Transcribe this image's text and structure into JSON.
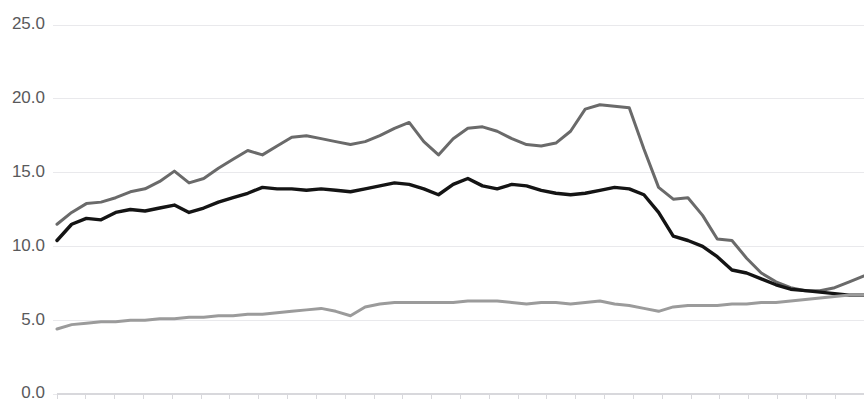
{
  "chart_data": {
    "type": "line",
    "title": "",
    "subtitle": "",
    "xlabel": "",
    "ylabel": "",
    "ylim": [
      0.0,
      25.0
    ],
    "xlim": [
      0,
      55
    ],
    "grid": true,
    "legend_position": "none",
    "y_ticks": [
      0.0,
      5.0,
      10.0,
      15.0,
      20.0,
      25.0
    ],
    "y_tick_labels": [
      "0.0",
      "5.0",
      "10.0",
      "15.0",
      "20.0",
      "25.0"
    ],
    "x_tick_labels": [],
    "x_minor_tick_count": 28,
    "colors": {
      "series_upper": "#6a6a6a",
      "series_middle": "#141414",
      "series_lower": "#9b9b9b",
      "gridline": "#e9e9ec",
      "axis": "#d8d8dc",
      "tick_label": "#59595b",
      "background": "#ffffff"
    },
    "x": [
      0,
      1,
      2,
      3,
      4,
      5,
      6,
      7,
      8,
      9,
      10,
      11,
      12,
      13,
      14,
      15,
      16,
      17,
      18,
      19,
      20,
      21,
      22,
      23,
      24,
      25,
      26,
      27,
      28,
      29,
      30,
      31,
      32,
      33,
      34,
      35,
      36,
      37,
      38,
      39,
      40,
      41,
      42,
      43,
      44,
      45,
      46,
      47,
      48,
      49,
      50,
      51,
      52,
      53,
      54,
      55
    ],
    "series": [
      {
        "name": "upper",
        "color": "#6a6a6a",
        "stroke_width": 3.0,
        "values": [
          11.5,
          12.3,
          12.9,
          13.0,
          13.3,
          13.7,
          13.9,
          14.4,
          15.1,
          14.3,
          14.6,
          15.3,
          15.9,
          16.5,
          16.2,
          16.8,
          17.4,
          17.5,
          17.3,
          17.1,
          16.9,
          17.1,
          17.5,
          18.0,
          18.4,
          17.1,
          16.2,
          17.3,
          18.0,
          18.1,
          17.8,
          17.3,
          16.9,
          16.8,
          17.0,
          17.8,
          19.3,
          19.6,
          19.5,
          19.4,
          16.6,
          14.0,
          13.2,
          13.3,
          12.1,
          10.5,
          10.4,
          9.2,
          8.2,
          7.6,
          7.2,
          7.0,
          7.0,
          7.2,
          7.6,
          8.0
        ]
      },
      {
        "name": "middle",
        "color": "#141414",
        "stroke_width": 3.4,
        "values": [
          10.4,
          11.5,
          11.9,
          11.8,
          12.3,
          12.5,
          12.4,
          12.6,
          12.8,
          12.3,
          12.6,
          13.0,
          13.3,
          13.6,
          14.0,
          13.9,
          13.9,
          13.8,
          13.9,
          13.8,
          13.7,
          13.9,
          14.1,
          14.3,
          14.2,
          13.9,
          13.5,
          14.2,
          14.6,
          14.1,
          13.9,
          14.2,
          14.1,
          13.8,
          13.6,
          13.5,
          13.6,
          13.8,
          14.0,
          13.9,
          13.5,
          12.3,
          10.7,
          10.4,
          10.0,
          9.3,
          8.4,
          8.2,
          7.8,
          7.4,
          7.1,
          7.0,
          6.9,
          6.8,
          6.7,
          6.7
        ]
      },
      {
        "name": "lower",
        "color": "#9b9b9b",
        "stroke_width": 3.0,
        "values": [
          4.4,
          4.7,
          4.8,
          4.9,
          4.9,
          5.0,
          5.0,
          5.1,
          5.1,
          5.2,
          5.2,
          5.3,
          5.3,
          5.4,
          5.4,
          5.5,
          5.6,
          5.7,
          5.8,
          5.6,
          5.3,
          5.9,
          6.1,
          6.2,
          6.2,
          6.2,
          6.2,
          6.2,
          6.3,
          6.3,
          6.3,
          6.2,
          6.1,
          6.2,
          6.2,
          6.1,
          6.2,
          6.3,
          6.1,
          6.0,
          5.8,
          5.6,
          5.9,
          6.0,
          6.0,
          6.0,
          6.1,
          6.1,
          6.2,
          6.2,
          6.3,
          6.4,
          6.5,
          6.6,
          6.7,
          6.7
        ]
      }
    ]
  },
  "layout": {
    "plot_left": 57,
    "plot_right": 864,
    "plot_top": 25,
    "plot_bottom": 394,
    "label_x": 45
  }
}
